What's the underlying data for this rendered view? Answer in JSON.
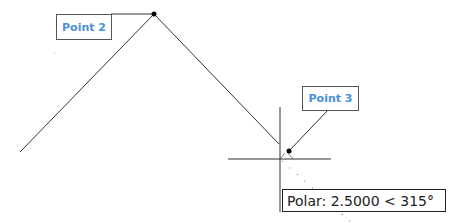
{
  "labels": {
    "point2": "Point 2",
    "point3": "Point 3"
  },
  "tooltip": {
    "text": "Polar: 2.5000 < 315°",
    "mode": "Polar",
    "distance": "2.5000",
    "angle": "315°"
  },
  "colors": {
    "label_text": "#4a90d9",
    "lines": "#333333",
    "background": "#ffffff"
  },
  "geometry": {
    "line1": {
      "x1": 20,
      "y1": 152,
      "x2": 154,
      "y2": 14
    },
    "line2": {
      "x1": 154,
      "y1": 14,
      "x2": 280,
      "y2": 144
    },
    "point2_dot": {
      "x": 154,
      "y": 14
    },
    "point3_dot": {
      "x": 289,
      "y": 151
    },
    "crosshair_center": {
      "x": 280,
      "y": 159
    }
  }
}
